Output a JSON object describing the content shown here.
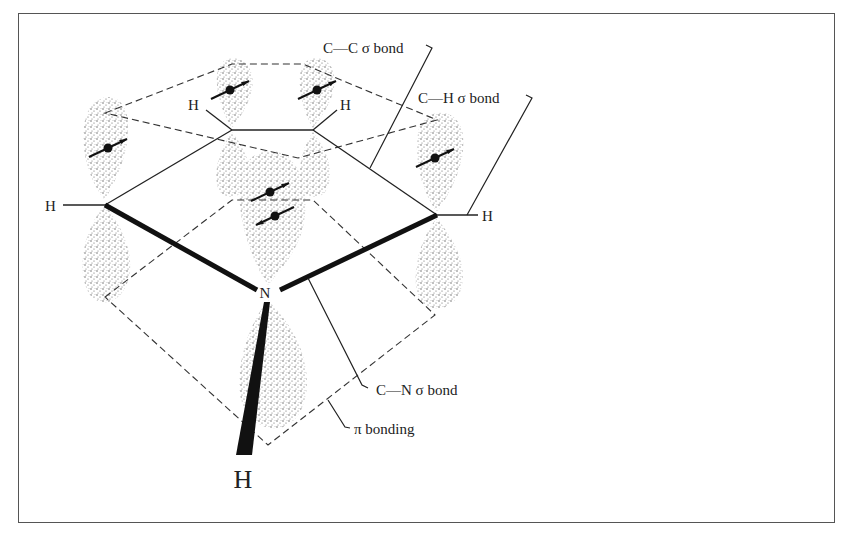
{
  "figure": {
    "labels": {
      "cc_sigma": "C—C σ bond",
      "ch_sigma": "C—H σ bond",
      "cn_sigma": "C—N σ bond",
      "pi_bonding": "π bonding"
    },
    "atoms": {
      "nitrogen": "N",
      "h_on_n": "H",
      "h_left": "H",
      "h_upper_left": "H",
      "h_upper_right": "H",
      "h_right": "H"
    },
    "orbitals": [
      {
        "name": "p-orbital-c2",
        "electrons": 1
      },
      {
        "name": "p-orbital-c3",
        "electrons": 1
      },
      {
        "name": "p-orbital-c4",
        "electrons": 1
      },
      {
        "name": "p-orbital-c5",
        "electrons": 1
      },
      {
        "name": "p-orbital-n",
        "electrons": 2
      }
    ],
    "colors": {
      "ink": "#111111",
      "stipple": "#555555",
      "background": "#ffffff"
    }
  }
}
